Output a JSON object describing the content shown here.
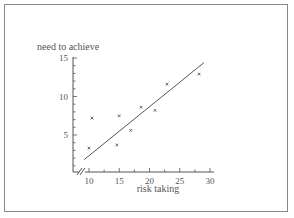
{
  "chart_data": {
    "type": "scatter",
    "title": "",
    "xlabel": "risk taking",
    "ylabel": "need to achieve",
    "xlim": [
      10,
      30
    ],
    "ylim": [
      0,
      15
    ],
    "x_ticks": [
      10,
      15,
      20,
      25,
      30
    ],
    "y_ticks": [
      5,
      10,
      15
    ],
    "x_axis_break": true,
    "grid": false,
    "legend": null,
    "series": [
      {
        "name": "observations",
        "marker": "x",
        "points": [
          {
            "x": 10.0,
            "y": 3.3
          },
          {
            "x": 10.5,
            "y": 7.2
          },
          {
            "x": 14.6,
            "y": 3.7
          },
          {
            "x": 15.0,
            "y": 7.5
          },
          {
            "x": 16.9,
            "y": 5.6
          },
          {
            "x": 18.6,
            "y": 8.6
          },
          {
            "x": 20.9,
            "y": 8.2
          },
          {
            "x": 22.9,
            "y": 11.6
          },
          {
            "x": 28.2,
            "y": 12.9
          }
        ]
      }
    ],
    "trend_line": {
      "name": "line of best fit",
      "start": {
        "x": 9.2,
        "y": 1.8
      },
      "end": {
        "x": 29.0,
        "y": 14.4
      }
    }
  },
  "labels": {
    "xlabel": "risk taking",
    "ylabel": "need to achieve",
    "xticks": [
      "10",
      "15",
      "20",
      "25",
      "30"
    ],
    "yticks": [
      "5",
      "10",
      "15"
    ]
  },
  "colors": {
    "axis": "#555555",
    "text": "#555555",
    "frame": "#8a8a8a",
    "points": "#555555",
    "line": "#555555"
  }
}
